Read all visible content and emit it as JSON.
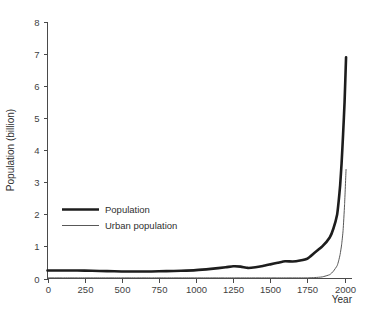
{
  "chart_data": {
    "type": "line",
    "title": "",
    "subtitle": "",
    "xlabel": "Year",
    "ylabel": "Population (billion)",
    "xlim": [
      0,
      2050
    ],
    "ylim": [
      0,
      8
    ],
    "grid": false,
    "legend_position": "inside-left-middle",
    "xticks": [
      0,
      250,
      500,
      750,
      1000,
      1250,
      1500,
      1750,
      2000
    ],
    "xtick_labels": [
      "0",
      "250",
      "500",
      "750",
      "1000",
      "1250",
      "1500",
      "1750",
      "2000"
    ],
    "yticks": [
      0,
      1,
      2,
      3,
      4,
      5,
      6,
      7,
      8
    ],
    "ytick_labels": [
      "0",
      "1",
      "2",
      "3",
      "4",
      "5",
      "6",
      "7",
      "8"
    ],
    "x": [
      0,
      100,
      200,
      300,
      400,
      500,
      600,
      700,
      800,
      900,
      1000,
      1100,
      1200,
      1250,
      1300,
      1350,
      1400,
      1450,
      1500,
      1550,
      1600,
      1650,
      1700,
      1750,
      1800,
      1850,
      1900,
      1925,
      1950,
      1960,
      1970,
      1980,
      1990,
      2000,
      2010
    ],
    "series": [
      {
        "name": "Population",
        "color": "#1d1d1d",
        "line_width": 2.6,
        "values": [
          0.25,
          0.25,
          0.25,
          0.24,
          0.23,
          0.22,
          0.22,
          0.22,
          0.23,
          0.24,
          0.26,
          0.3,
          0.35,
          0.38,
          0.37,
          0.33,
          0.35,
          0.39,
          0.44,
          0.49,
          0.54,
          0.53,
          0.56,
          0.62,
          0.81,
          1.0,
          1.28,
          1.56,
          2.0,
          2.4,
          2.9,
          3.6,
          4.5,
          5.5,
          6.9
        ]
      },
      {
        "name": "Urban population",
        "color": "#585858",
        "line_width": 1.0,
        "values": [
          0.02,
          0.02,
          0.02,
          0.02,
          0.02,
          0.02,
          0.02,
          0.02,
          0.02,
          0.02,
          0.02,
          0.02,
          0.02,
          0.02,
          0.02,
          0.02,
          0.02,
          0.02,
          0.02,
          0.02,
          0.02,
          0.02,
          0.02,
          0.02,
          0.03,
          0.05,
          0.12,
          0.23,
          0.4,
          0.55,
          0.75,
          1.05,
          1.5,
          2.3,
          3.4
        ]
      }
    ],
    "annotations": []
  },
  "legend": {
    "entries": [
      {
        "label": "Population",
        "swatch": "thick-line-swatch"
      },
      {
        "label": "Urban population",
        "swatch": "thin-line-swatch"
      }
    ]
  },
  "colors": {
    "background": "#ffffff",
    "axis": "#4a4a4a",
    "text": "#2f2f2f",
    "series_total": "#1d1d1d",
    "series_urban": "#585858"
  }
}
